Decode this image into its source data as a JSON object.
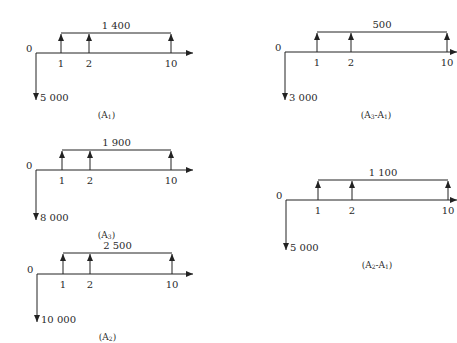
{
  "diagrams": [
    {
      "id": "A1",
      "caption": "(A1)",
      "caption_main": "(A",
      "caption_sub": "1",
      "caption_end": ")",
      "origin_label": "0",
      "ticks": [
        "1",
        "2",
        "10"
      ],
      "annuity_label": "1 400",
      "initial_outflow_label": "5 000",
      "geom": {
        "x0": 36,
        "y": 53,
        "x1": 61,
        "x2": 89,
        "x10": 171,
        "xend": 193,
        "bar_y": 33,
        "down_y": 100
      }
    },
    {
      "id": "A3",
      "caption": "(A3)",
      "caption_main": "(A",
      "caption_sub": "3",
      "caption_end": ")",
      "origin_label": "0",
      "ticks": [
        "1",
        "2",
        "10"
      ],
      "annuity_label": "1 900",
      "initial_outflow_label": "8 000",
      "geom": {
        "x0": 36,
        "y": 170,
        "x1": 62,
        "x2": 90,
        "x10": 171,
        "xend": 193,
        "bar_y": 150,
        "down_y": 220
      }
    },
    {
      "id": "A2",
      "caption": "(A2)",
      "caption_main": "(A",
      "caption_sub": "2",
      "caption_end": ")",
      "origin_label": "0",
      "ticks": [
        "1",
        "2",
        "10"
      ],
      "annuity_label": "2 500",
      "initial_outflow_label": "10 000",
      "geom": {
        "x0": 37,
        "y": 274,
        "x1": 63,
        "x2": 90,
        "x10": 172,
        "xend": 193,
        "bar_y": 253,
        "down_y": 322
      }
    },
    {
      "id": "A3-A1",
      "caption": "(A3-A1)",
      "caption_main": "(A",
      "caption_sub": "3",
      "caption_mid": "-A",
      "caption_sub2": "1",
      "caption_end": ")",
      "origin_label": "0",
      "ticks": [
        "1",
        "2",
        "10"
      ],
      "annuity_label": "500",
      "initial_outflow_label": "3 000",
      "geom": {
        "x0": 285,
        "y": 52,
        "x1": 317,
        "x2": 351,
        "x10": 447,
        "xend": 457,
        "bar_y": 32,
        "down_y": 100
      }
    },
    {
      "id": "A2-A1",
      "caption": "(A2-A1)",
      "caption_main": "(A",
      "caption_sub": "2",
      "caption_mid": "-A",
      "caption_sub2": "1",
      "caption_end": ")",
      "origin_label": "0",
      "ticks": [
        "1",
        "2",
        "10"
      ],
      "annuity_label": "1 100",
      "initial_outflow_label": "5 000",
      "geom": {
        "x0": 286,
        "y": 200,
        "x1": 318,
        "x2": 352,
        "x10": 448,
        "xend": 457,
        "bar_y": 180,
        "down_y": 250
      }
    }
  ]
}
